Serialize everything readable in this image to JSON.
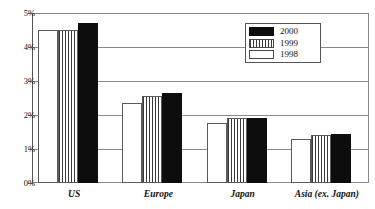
{
  "chart_data": {
    "type": "bar",
    "title": "",
    "xlabel": "",
    "ylabel": "",
    "ylim": [
      0,
      5
    ],
    "ytick_labels": [
      "5%",
      "4%",
      "3%",
      "2%",
      "1%",
      "0%"
    ],
    "ytick_values": [
      5,
      4,
      3,
      2,
      1,
      0
    ],
    "grid": true,
    "legend_position": "top-right",
    "categories": [
      "US",
      "Europe",
      "Japan",
      "Asia (ex. Japan)"
    ],
    "series": [
      {
        "name": "1998",
        "values": [
          4.5,
          2.35,
          1.77,
          1.3
        ],
        "color": "#ffffff",
        "pattern": "solid-white"
      },
      {
        "name": "1999",
        "values": [
          4.5,
          2.55,
          1.9,
          1.4
        ],
        "color": "#3a3a3a",
        "pattern": "vertical-lines"
      },
      {
        "name": "2000",
        "values": [
          4.7,
          2.65,
          1.9,
          1.45
        ],
        "color": "#0d0d0d",
        "pattern": "solid-black"
      }
    ]
  },
  "legend": {
    "entries": [
      {
        "label": "2000",
        "swatch": "solid-black"
      },
      {
        "label": "1999",
        "swatch": "vertical-lines"
      },
      {
        "label": "1998",
        "swatch": "solid-white"
      }
    ]
  },
  "axis": {
    "y": {
      "ticks": [
        {
          "label": "5%",
          "value": 5
        },
        {
          "label": "4%",
          "value": 4
        },
        {
          "label": "3%",
          "value": 3
        },
        {
          "label": "2%",
          "value": 2
        },
        {
          "label": "1%",
          "value": 1
        },
        {
          "label": "0%",
          "value": 0
        }
      ]
    },
    "x": {
      "labels": [
        "US",
        "Europe",
        "Japan",
        "Asia (ex. Japan)"
      ]
    }
  },
  "colors": {
    "series_2000": "#0d0d0d",
    "series_1999": "#3a3a3a",
    "series_1998": "#ffffff",
    "gridline": "#8a8a8a",
    "frame": "#888888",
    "text": "#111111"
  }
}
